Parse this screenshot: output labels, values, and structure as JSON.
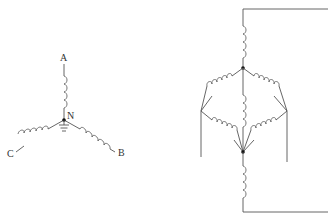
{
  "diagrams": [
    {
      "id": "wye",
      "description": "Wye (star) connection with grounded neutral",
      "labels": {
        "a": "A",
        "b": "B",
        "c": "C",
        "n": "N"
      },
      "neutral_grounded": true
    },
    {
      "id": "bridge",
      "description": "Bridge / lattice network of inductive windings between two nodes, with series windings to external leads"
    }
  ],
  "colors": {
    "line": "#555555",
    "node": "#111111",
    "background": "#ffffff"
  }
}
